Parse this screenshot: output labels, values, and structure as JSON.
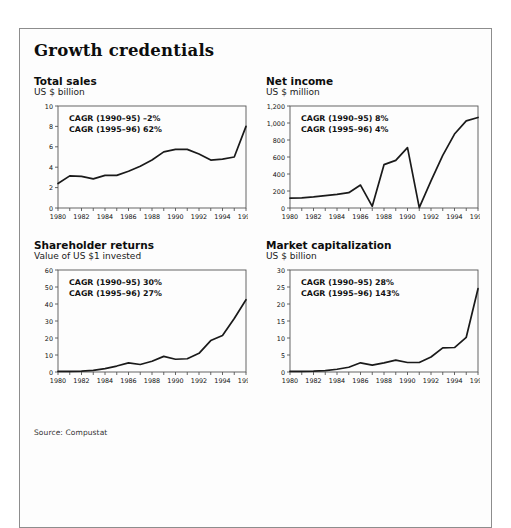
{
  "exhibit": {
    "title": "Growth credentials",
    "source_note": "Source: Compustat"
  },
  "chart_data": [
    {
      "id": "total-sales",
      "type": "line",
      "title": "Total sales",
      "subtitle": "US $ billion",
      "xlabel": "",
      "ylabel": "US $ billion",
      "ylim": [
        0,
        10
      ],
      "yticks": [
        0,
        2,
        4,
        6,
        8,
        10
      ],
      "yticklabels": [
        "0",
        "2",
        "4",
        "6",
        "8",
        "10"
      ],
      "xlim": [
        1980,
        1996
      ],
      "xticks": [
        1980,
        1982,
        1984,
        1986,
        1988,
        1990,
        1992,
        1994,
        1996
      ],
      "xticklabels": [
        "1980",
        "1982",
        "1984",
        "1986",
        "1988",
        "1990",
        "1992",
        "1994",
        "1996"
      ],
      "grid": false,
      "legend": "none",
      "annotations": [
        "CAGR (1990–95) –2%",
        "CAGR (1995–96) 62%"
      ],
      "x": [
        1980,
        1981,
        1982,
        1983,
        1984,
        1985,
        1986,
        1987,
        1988,
        1989,
        1990,
        1991,
        1992,
        1993,
        1994,
        1995,
        1996
      ],
      "values": [
        2.4,
        3.15,
        3.1,
        2.85,
        3.2,
        3.2,
        3.6,
        4.1,
        4.7,
        5.5,
        5.75,
        5.75,
        5.3,
        4.7,
        4.8,
        5.0,
        8.0
      ]
    },
    {
      "id": "net-income",
      "type": "line",
      "title": "Net income",
      "subtitle": "US $ million",
      "xlabel": "",
      "ylabel": "US $ million",
      "ylim": [
        0,
        1200
      ],
      "yticks": [
        0,
        200,
        400,
        600,
        800,
        1000,
        1200
      ],
      "yticklabels": [
        "0",
        "200",
        "400",
        "600",
        "800",
        "1,000",
        "1,200"
      ],
      "xlim": [
        1980,
        1996
      ],
      "xticks": [
        1980,
        1982,
        1984,
        1986,
        1988,
        1990,
        1992,
        1994,
        1996
      ],
      "xticklabels": [
        "1980",
        "1982",
        "1984",
        "1986",
        "1988",
        "1990",
        "1992",
        "1994",
        "1996"
      ],
      "grid": false,
      "legend": "none",
      "annotations": [
        "CAGR (1990–95) 8%",
        "CAGR (1995–96) 4%"
      ],
      "x": [
        1980,
        1981,
        1982,
        1983,
        1984,
        1985,
        1986,
        1987,
        1988,
        1989,
        1990,
        1991,
        1992,
        1993,
        1994,
        1995,
        1996
      ],
      "values": [
        115,
        120,
        130,
        145,
        160,
        180,
        270,
        20,
        510,
        560,
        710,
        5,
        320,
        620,
        870,
        1025,
        1065
      ]
    },
    {
      "id": "shareholder-returns",
      "type": "line",
      "title": "Shareholder returns",
      "subtitle": "Value of US $1 invested",
      "xlabel": "",
      "ylabel": "Value of US $1 invested",
      "ylim": [
        0,
        60
      ],
      "yticks": [
        0,
        10,
        20,
        30,
        40,
        50,
        60
      ],
      "yticklabels": [
        "0",
        "10",
        "20",
        "30",
        "40",
        "50",
        "60"
      ],
      "xlim": [
        1980,
        1996
      ],
      "xticks": [
        1980,
        1982,
        1984,
        1986,
        1988,
        1990,
        1992,
        1994,
        1996
      ],
      "xticklabels": [
        "1980",
        "1982",
        "1984",
        "1986",
        "1988",
        "1990",
        "1992",
        "1994",
        "1996"
      ],
      "grid": false,
      "legend": "none",
      "annotations": [
        "CAGR (1990–95) 30%",
        "CAGR (1995–96) 27%"
      ],
      "x": [
        1980,
        1981,
        1982,
        1983,
        1984,
        1985,
        1986,
        1987,
        1988,
        1989,
        1990,
        1991,
        1992,
        1993,
        1994,
        1995,
        1996
      ],
      "values": [
        0.4,
        0.4,
        0.5,
        1.0,
        2.0,
        3.5,
        5.4,
        4.4,
        6.3,
        9.2,
        7.5,
        7.8,
        11.0,
        18.5,
        21.5,
        31.5,
        42.5
      ]
    },
    {
      "id": "market-capitalization",
      "type": "line",
      "title": "Market capitalization",
      "subtitle": "US $ billion",
      "xlabel": "",
      "ylabel": "US $ billion",
      "ylim": [
        0,
        30
      ],
      "yticks": [
        0,
        5,
        10,
        15,
        20,
        25,
        30
      ],
      "yticklabels": [
        "0",
        "5",
        "10",
        "15",
        "20",
        "25",
        "30"
      ],
      "xlim": [
        1980,
        1996
      ],
      "xticks": [
        1980,
        1982,
        1984,
        1986,
        1988,
        1990,
        1992,
        1994,
        1996
      ],
      "xticklabels": [
        "1980",
        "1982",
        "1984",
        "1986",
        "1988",
        "1990",
        "1992",
        "1994",
        "1996"
      ],
      "grid": false,
      "legend": "none",
      "annotations": [
        "CAGR (1990–95) 28%",
        "CAGR (1995–96) 143%"
      ],
      "x": [
        1980,
        1981,
        1982,
        1983,
        1984,
        1985,
        1986,
        1987,
        1988,
        1989,
        1990,
        1991,
        1992,
        1993,
        1994,
        1995,
        1996
      ],
      "values": [
        0.2,
        0.2,
        0.25,
        0.4,
        0.8,
        1.4,
        2.7,
        2.0,
        2.7,
        3.5,
        2.8,
        2.8,
        4.4,
        7.1,
        7.2,
        10.2,
        24.5
      ]
    }
  ],
  "style": {
    "line_color": "#1a1a1a",
    "axis_color": "#555555",
    "frame_color": "#8d8d8d",
    "text_color": "#111111"
  }
}
